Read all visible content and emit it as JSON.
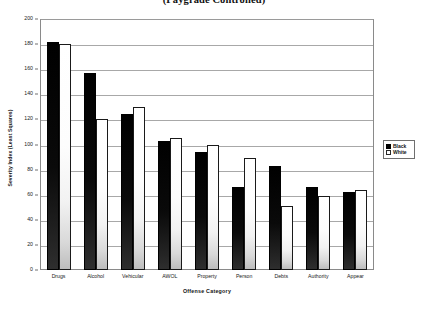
{
  "chart_data": {
    "type": "bar",
    "title": "(Paygrade Controlled)",
    "xlabel": "Offense Category",
    "ylabel": "Severity Index (Least Squares)",
    "ylim": [
      0,
      200
    ],
    "ytick_step": 20,
    "yticks": [
      0,
      20,
      40,
      60,
      80,
      100,
      120,
      140,
      160,
      180,
      200
    ],
    "grid": true,
    "legend_position": "right",
    "categories": [
      "Drugs",
      "Alcohol",
      "Vehicular",
      "AWOL",
      "Property",
      "Person",
      "Debts",
      "Authority",
      "Appear"
    ],
    "series": [
      {
        "name": "Black",
        "color": "#000000",
        "values": [
          182,
          157,
          124,
          103,
          94,
          66,
          83,
          66,
          62
        ]
      },
      {
        "name": "White",
        "color": "#ffffff",
        "values": [
          180,
          120,
          130,
          105,
          100,
          89,
          51,
          59,
          64
        ]
      }
    ]
  },
  "axes": {
    "y_title": "Severity Index (Least Squares)",
    "x_title": "Offense Category"
  },
  "legend": {
    "items": [
      {
        "label": "Black",
        "swatch": "filled-square"
      },
      {
        "label": "White",
        "swatch": "outlined-square"
      }
    ]
  }
}
